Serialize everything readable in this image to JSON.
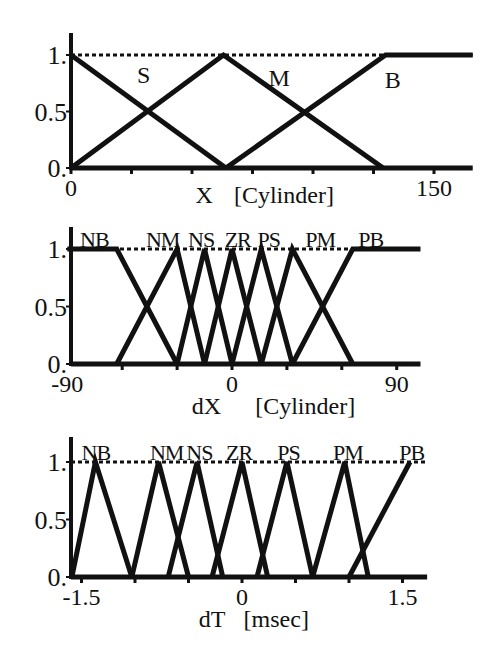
{
  "chart_data": [
    {
      "type": "line",
      "subtype": "fuzzy-membership",
      "title": "",
      "xlabel": "X",
      "xunit": "[Cylinder]",
      "ylabel": "",
      "xlim": [
        0,
        166
      ],
      "ylim": [
        0,
        1
      ],
      "x_ticks": [
        0,
        25,
        50,
        75,
        100,
        125,
        150
      ],
      "x_tick_labels": [
        {
          "value": 0,
          "label": "0"
        },
        {
          "value": 150,
          "label": "150"
        }
      ],
      "y_tick_labels": [
        {
          "value": 1,
          "label": "1."
        },
        {
          "value": 0.5,
          "label": "0.5"
        },
        {
          "value": 0,
          "label": "0."
        }
      ],
      "reference_line": {
        "y": 1,
        "style": "dotted"
      },
      "grid": false,
      "legend": "inline labels",
      "series": [
        {
          "name": "S",
          "x": [
            0,
            64
          ],
          "y": [
            1,
            0
          ],
          "label_pos": [
            30,
            0.82
          ]
        },
        {
          "name": "M",
          "x": [
            0,
            63,
            129
          ],
          "y": [
            0,
            1,
            0
          ],
          "label_pos": [
            86,
            0.8
          ]
        },
        {
          "name": "B",
          "x": [
            64,
            130,
            166
          ],
          "y": [
            0,
            1,
            1
          ],
          "label_pos": [
            133,
            0.78
          ]
        }
      ],
      "baseline": {
        "x": [
          0,
          166
        ]
      },
      "layout": {
        "axis_x": 71,
        "x0": 71,
        "px_per_unit": 2.42,
        "y1": 55,
        "y0": 168,
        "y_axis_top": 33,
        "tick_y": 168
      }
    },
    {
      "type": "line",
      "subtype": "fuzzy-membership",
      "title": "",
      "xlabel": "dX",
      "xunit": "[Cylinder]",
      "ylabel": "",
      "xlim": [
        -90,
        103
      ],
      "ylim": [
        0,
        1
      ],
      "x_ticks": [
        -60,
        -30,
        0,
        30,
        60,
        90
      ],
      "x_tick_labels": [
        {
          "value": -90,
          "label": "-90"
        },
        {
          "value": 0,
          "label": "0"
        },
        {
          "value": 90,
          "label": "90"
        }
      ],
      "y_tick_labels": [
        {
          "value": 1,
          "label": "1."
        },
        {
          "value": 0.5,
          "label": "0.5"
        },
        {
          "value": 0,
          "label": "0."
        }
      ],
      "reference_line": {
        "y": 1,
        "style": "dotted"
      },
      "grid": false,
      "legend": "inline labels",
      "series": [
        {
          "name": "NB",
          "x": [
            -90,
            -63,
            -30
          ],
          "y": [
            1,
            1,
            0
          ],
          "label_x": -83
        },
        {
          "name": "NM",
          "x": [
            -63,
            -30,
            -15
          ],
          "y": [
            0,
            1,
            0
          ],
          "label_x": -47
        },
        {
          "name": "NS",
          "x": [
            -30,
            -15,
            0
          ],
          "y": [
            0,
            1,
            0
          ],
          "label_x": -24
        },
        {
          "name": "ZR",
          "x": [
            -15,
            0,
            16
          ],
          "y": [
            0,
            1,
            0
          ],
          "label_x": -4
        },
        {
          "name": "PS",
          "x": [
            0,
            16,
            33
          ],
          "y": [
            0,
            1,
            0
          ],
          "label_x": 14
        },
        {
          "name": "PM",
          "x": [
            16,
            33,
            66
          ],
          "y": [
            0,
            1,
            0
          ],
          "label_x": 40
        },
        {
          "name": "PB",
          "x": [
            33,
            66,
            103
          ],
          "y": [
            0,
            1,
            1
          ],
          "label_x": 69
        }
      ],
      "baseline": {
        "x": [
          -90,
          103
        ]
      },
      "layout": {
        "axis_x": 71,
        "x0": 232,
        "px_per_unit": 1.83,
        "y1": 249,
        "y0": 364,
        "y_axis_top": 227,
        "tick_y": 364
      }
    },
    {
      "type": "line",
      "subtype": "fuzzy-membership",
      "title": "",
      "xlabel": "dT",
      "xunit": "[msec]",
      "ylabel": "",
      "xlim": [
        -1.59,
        1.73
      ],
      "ylim": [
        0,
        1
      ],
      "x_ticks": [
        -1.5,
        -1.0,
        -0.5,
        0,
        0.5,
        1.0,
        1.5
      ],
      "x_tick_labels": [
        {
          "value": -1.5,
          "label": "-1.5"
        },
        {
          "value": 0,
          "label": "0"
        },
        {
          "value": 1.5,
          "label": "1.5"
        }
      ],
      "y_tick_labels": [
        {
          "value": 1,
          "label": "1."
        },
        {
          "value": 0.5,
          "label": "0.5"
        },
        {
          "value": 0,
          "label": "0."
        }
      ],
      "reference_line": {
        "y": 1,
        "style": "dotted"
      },
      "grid": false,
      "legend": "inline labels",
      "series": [
        {
          "name": "NB",
          "x": [
            -1.59,
            -1.37,
            -1.03
          ],
          "y": [
            0,
            1,
            0
          ],
          "label_x": -1.5
        },
        {
          "name": "NM",
          "x": [
            -1.03,
            -0.78,
            -0.5
          ],
          "y": [
            0,
            1,
            0
          ],
          "label_x": -0.86
        },
        {
          "name": "NS",
          "x": [
            -0.69,
            -0.42,
            -0.18
          ],
          "y": [
            0,
            1,
            0
          ],
          "label_x": -0.52
        },
        {
          "name": "ZR",
          "x": [
            -0.28,
            0,
            0.24
          ],
          "y": [
            0,
            1,
            0
          ],
          "label_x": -0.15
        },
        {
          "name": "PS",
          "x": [
            0.14,
            0.42,
            0.66
          ],
          "y": [
            0,
            1,
            0
          ],
          "label_x": 0.33
        },
        {
          "name": "PM",
          "x": [
            0.66,
            0.96,
            1.18
          ],
          "y": [
            0,
            1,
            0
          ],
          "label_x": 0.85
        },
        {
          "name": "PB",
          "x": [
            1.0,
            1.57
          ],
          "y": [
            0,
            1
          ],
          "label_x": 1.47
        }
      ],
      "baseline": {
        "x": [
          -1.59,
          1.73
        ]
      },
      "layout": {
        "axis_x": 71,
        "x0": 242,
        "px_per_unit": 107,
        "y1": 462,
        "y0": 577,
        "y_axis_top": 437,
        "tick_y": 577
      }
    }
  ],
  "style": {
    "line_color": "#111111",
    "background": "#ffffff",
    "stroke_width": 5
  }
}
